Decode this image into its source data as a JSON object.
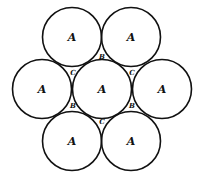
{
  "diagram": {
    "title": "",
    "circle_radius": 29.5,
    "stroke_color": "#111111",
    "circles": [
      {
        "label": "A",
        "cx": 72,
        "cy": 37
      },
      {
        "label": "A",
        "cx": 131,
        "cy": 37
      },
      {
        "label": "A",
        "cx": 42,
        "cy": 89
      },
      {
        "label": "A",
        "cx": 102,
        "cy": 89
      },
      {
        "label": "A",
        "cx": 162,
        "cy": 89
      },
      {
        "label": "A",
        "cx": 72,
        "cy": 141
      },
      {
        "label": "A",
        "cx": 131,
        "cy": 141
      }
    ],
    "interstitial_labels": [
      {
        "label": "B",
        "x": 102,
        "y": 57
      },
      {
        "label": "C",
        "x": 72,
        "y": 72
      },
      {
        "label": "C",
        "x": 132,
        "y": 72
      },
      {
        "label": "B",
        "x": 72,
        "y": 106
      },
      {
        "label": "B",
        "x": 132,
        "y": 106
      },
      {
        "label": "C",
        "x": 102,
        "y": 122
      }
    ]
  }
}
